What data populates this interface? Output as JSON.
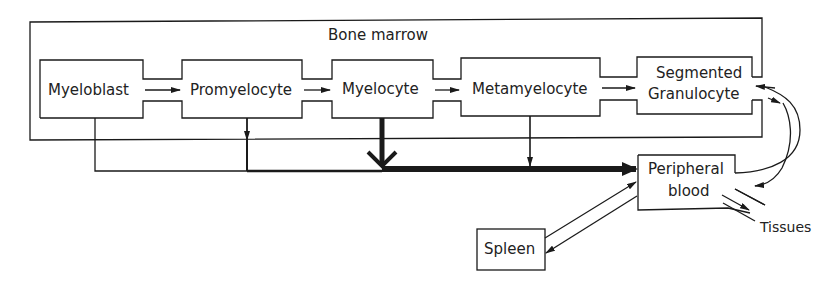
{
  "title": "Bone marrow",
  "nodes": {
    "myeloblast": "Myeloblast",
    "promyelocyte": "Promyelocyte",
    "myelocyte": "Myelocyte",
    "metamyelocyte": "Metamyelocyte",
    "segmented_line1": "Segmented",
    "segmented_line2": "Granulocyte",
    "peripheral_line1": "Peripheral",
    "peripheral_line2": "blood",
    "spleen": "Spleen",
    "tissues": "Tissues"
  },
  "colors": {
    "stroke": "#1a1a1a",
    "text": "#222222",
    "background": "#ffffff"
  }
}
